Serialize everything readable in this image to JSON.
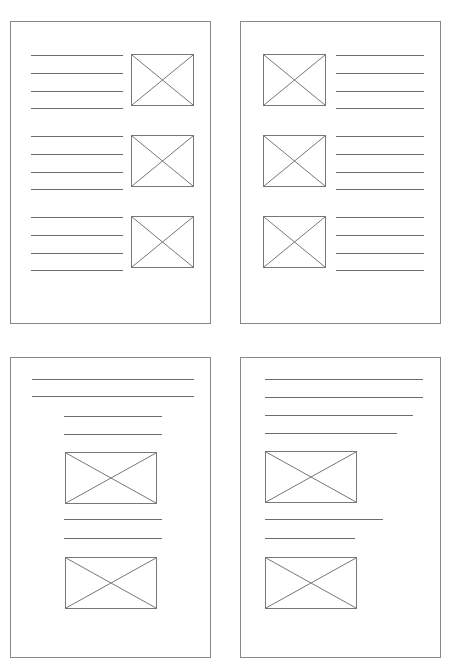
{
  "figure": {
    "type": "wireframe-figure",
    "sheet_rule": {
      "present": true
    },
    "colors": {
      "stroke": "#777777",
      "rule": "#6b6b6b",
      "page_border": "#888888",
      "background": "#ffffff"
    },
    "pages": [
      {
        "id": "page-top-left",
        "label": "Layout A — text left, image right, three blocks",
        "rect": {
          "x": 10,
          "y": 21,
          "w": 201,
          "h": 303
        },
        "blocks": [
          {
            "label": "block-1",
            "image": {
              "x": 120,
              "y": 32,
              "w": 63,
              "h": 52
            },
            "lines": [
              {
                "x": 20,
                "y": 33,
                "w": 92
              },
              {
                "x": 20,
                "y": 51,
                "w": 92
              },
              {
                "x": 20,
                "y": 69,
                "w": 92
              },
              {
                "x": 20,
                "y": 86,
                "w": 92
              }
            ]
          },
          {
            "label": "block-2",
            "image": {
              "x": 120,
              "y": 113,
              "w": 63,
              "h": 52
            },
            "lines": [
              {
                "x": 20,
                "y": 114,
                "w": 92
              },
              {
                "x": 20,
                "y": 132,
                "w": 92
              },
              {
                "x": 20,
                "y": 150,
                "w": 92
              },
              {
                "x": 20,
                "y": 167,
                "w": 92
              }
            ]
          },
          {
            "label": "block-3",
            "image": {
              "x": 120,
              "y": 194,
              "w": 63,
              "h": 52
            },
            "lines": [
              {
                "x": 20,
                "y": 195,
                "w": 92
              },
              {
                "x": 20,
                "y": 213,
                "w": 92
              },
              {
                "x": 20,
                "y": 231,
                "w": 92
              },
              {
                "x": 20,
                "y": 248,
                "w": 92
              }
            ]
          }
        ]
      },
      {
        "id": "page-top-right",
        "label": "Layout B — image left, text right, three blocks",
        "rect": {
          "x": 240,
          "y": 21,
          "w": 201,
          "h": 303
        },
        "blocks": [
          {
            "label": "block-1",
            "image": {
              "x": 22,
              "y": 32,
              "w": 63,
              "h": 52
            },
            "lines": [
              {
                "x": 95,
                "y": 33,
                "w": 88
              },
              {
                "x": 95,
                "y": 51,
                "w": 88
              },
              {
                "x": 95,
                "y": 69,
                "w": 88
              },
              {
                "x": 95,
                "y": 86,
                "w": 88
              }
            ]
          },
          {
            "label": "block-2",
            "image": {
              "x": 22,
              "y": 113,
              "w": 63,
              "h": 52
            },
            "lines": [
              {
                "x": 95,
                "y": 114,
                "w": 88
              },
              {
                "x": 95,
                "y": 132,
                "w": 88
              },
              {
                "x": 95,
                "y": 150,
                "w": 88
              },
              {
                "x": 95,
                "y": 167,
                "w": 88
              }
            ]
          },
          {
            "label": "block-3",
            "image": {
              "x": 22,
              "y": 194,
              "w": 63,
              "h": 52
            },
            "lines": [
              {
                "x": 95,
                "y": 195,
                "w": 88
              },
              {
                "x": 95,
                "y": 213,
                "w": 88
              },
              {
                "x": 95,
                "y": 231,
                "w": 88
              },
              {
                "x": 95,
                "y": 248,
                "w": 88
              }
            ]
          }
        ]
      },
      {
        "id": "page-bottom-left",
        "label": "Layout C — full-width headings, indented text, centered images",
        "rect": {
          "x": 10,
          "y": 357,
          "w": 201,
          "h": 301
        },
        "blocks": [
          {
            "label": "block-1",
            "image": null,
            "lines": [
              {
                "x": 21,
                "y": 21,
                "w": 162
              },
              {
                "x": 21,
                "y": 38,
                "w": 162
              },
              {
                "x": 53,
                "y": 58,
                "w": 98
              },
              {
                "x": 53,
                "y": 76,
                "w": 98
              }
            ]
          },
          {
            "label": "block-2",
            "image": {
              "x": 54,
              "y": 94,
              "w": 92,
              "h": 52
            },
            "lines": []
          },
          {
            "label": "block-3",
            "image": null,
            "lines": [
              {
                "x": 53,
                "y": 161,
                "w": 98
              },
              {
                "x": 53,
                "y": 180,
                "w": 98
              }
            ]
          },
          {
            "label": "block-4",
            "image": {
              "x": 54,
              "y": 199,
              "w": 92,
              "h": 52
            },
            "lines": []
          }
        ]
      },
      {
        "id": "page-bottom-right",
        "label": "Layout D — ragged text block, left-aligned images",
        "rect": {
          "x": 240,
          "y": 357,
          "w": 201,
          "h": 301
        },
        "blocks": [
          {
            "label": "block-1",
            "image": null,
            "lines": [
              {
                "x": 24,
                "y": 21,
                "w": 158
              },
              {
                "x": 24,
                "y": 39,
                "w": 158
              },
              {
                "x": 24,
                "y": 57,
                "w": 148
              },
              {
                "x": 24,
                "y": 75,
                "w": 132
              }
            ]
          },
          {
            "label": "block-2",
            "image": {
              "x": 24,
              "y": 93,
              "w": 92,
              "h": 52
            },
            "lines": []
          },
          {
            "label": "block-3",
            "image": null,
            "lines": [
              {
                "x": 24,
                "y": 161,
                "w": 118
              },
              {
                "x": 24,
                "y": 180,
                "w": 90
              }
            ]
          },
          {
            "label": "block-4",
            "image": {
              "x": 24,
              "y": 199,
              "w": 92,
              "h": 52
            },
            "lines": []
          }
        ]
      }
    ]
  }
}
